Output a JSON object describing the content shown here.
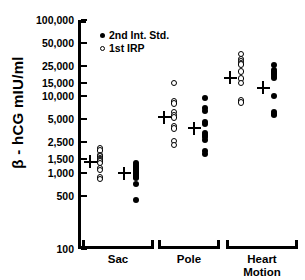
{
  "chart_data": {
    "type": "scatter",
    "title": "",
    "xlabel": "",
    "ylabel": "β - hCG mIU/ml",
    "yscale": "log",
    "ylim": [
      100,
      100000
    ],
    "grid": false,
    "legend_position": "top-left",
    "ytick_labels": [
      "100,000",
      "50,000",
      "25,000",
      "15,000",
      "10,000",
      "5,000",
      "2,500",
      "1,500",
      "1,000",
      "500",
      "100"
    ],
    "ytick_values": [
      100000,
      50000,
      25000,
      15000,
      10000,
      5000,
      2500,
      1500,
      1000,
      500,
      100
    ],
    "categories": [
      "Sac",
      "Pole",
      "Heart Motion"
    ],
    "legend": [
      {
        "name": "2nd Int. Std.",
        "marker": "filled-circle"
      },
      {
        "name": "1st IRP",
        "marker": "open-circle"
      }
    ],
    "series": [
      {
        "name": "1st IRP",
        "marker": "open-circle",
        "groups": [
          {
            "category": "Sac",
            "mean": 1400,
            "values": [
              2100,
              1950,
              1700,
              1620,
              1560,
              1520,
              1450,
              1400,
              1330,
              1150,
              1080,
              870,
              820
            ]
          },
          {
            "category": "Pole",
            "mean": 5300,
            "values": [
              15000,
              8600,
              8100,
              6200,
              5700,
              5300,
              4100,
              3800,
              2600,
              2300
            ]
          },
          {
            "category": "Heart Motion",
            "mean": 17500,
            "values": [
              36000,
              31000,
              29000,
              27000,
              26000,
              21000,
              17000,
              15000,
              8800,
              8300
            ]
          }
        ]
      },
      {
        "name": "2nd Int. Std.",
        "marker": "filled-circle",
        "groups": [
          {
            "category": "Sac",
            "mean": 980,
            "values": [
              1320,
              1250,
              1200,
              1150,
              1120,
              1080,
              1050,
              1020,
              990,
              960,
              930,
              900,
              870,
              840,
              700,
              440
            ]
          },
          {
            "category": "Pole",
            "mean": 3800,
            "values": [
              9500,
              7000,
              6500,
              4600,
              4400,
              3300,
              3100,
              2900,
              2700,
              1900,
              1750
            ]
          },
          {
            "category": "Heart Motion",
            "mean": 13000,
            "values": [
              26000,
              22000,
              21000,
              20500,
              19500,
              18500,
              17500,
              10000,
              6200,
              5900,
              5700
            ]
          }
        ]
      }
    ]
  },
  "legend": {
    "item_int_std": "2nd Int. Std.",
    "item_irp": "1st IRP"
  },
  "axis": {
    "y_title": "β - hCG mIU/ml",
    "t0": "100,000",
    "t1": "50,000",
    "t2": "25,000",
    "t3": "15,000",
    "t4": "10,000",
    "t5": "5,000",
    "t6": "2,500",
    "t7": "1,500",
    "t8": "1,000",
    "t9": "500",
    "t10": "100"
  },
  "groups": {
    "sac": "Sac",
    "pole": "Pole",
    "heart_line1": "Heart",
    "heart_line2": "Motion"
  }
}
